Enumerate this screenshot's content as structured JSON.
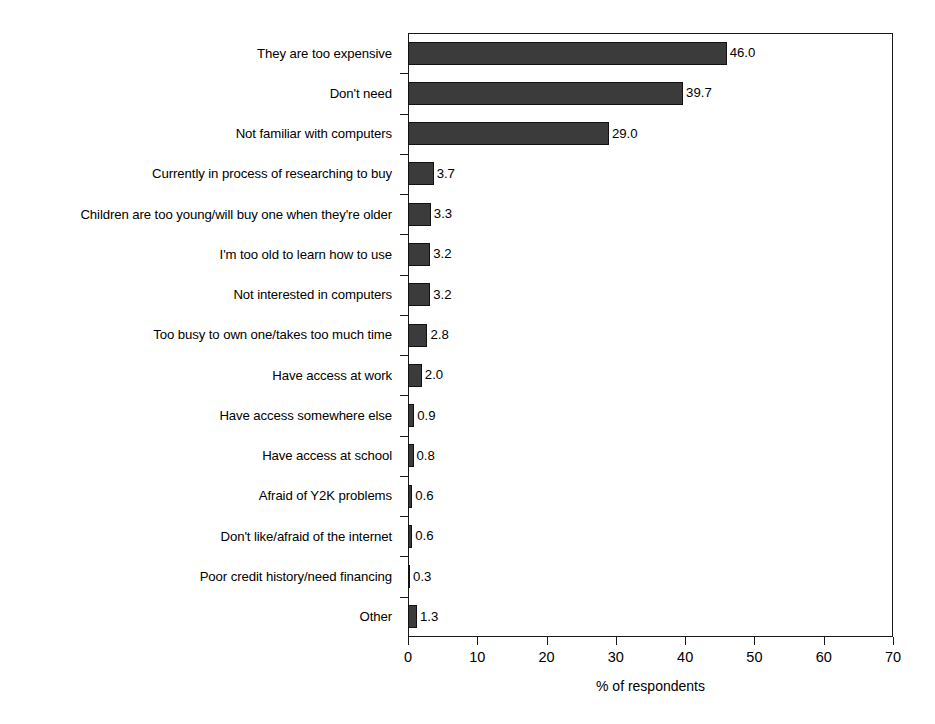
{
  "chart_data": {
    "type": "bar",
    "orientation": "horizontal",
    "title": "",
    "xlabel": "% of respondents",
    "ylabel": "",
    "xlim": [
      0,
      70
    ],
    "xticks": [
      0,
      10,
      20,
      30,
      40,
      50,
      60,
      70
    ],
    "grid": false,
    "legend": false,
    "bar_color": "#3b3b3b",
    "bar_edge_color": "#111111",
    "categories": [
      "They are too expensive",
      "Don't need",
      "Not familiar with computers",
      "Currently in process of researching to buy",
      "Children are too young/will buy one when they're older",
      "I'm too old to learn how to use",
      "Not interested in computers",
      "Too busy to own one/takes too much time",
      "Have access at work",
      "Have access somewhere else",
      "Have access at school",
      "Afraid of Y2K problems",
      "Don't like/afraid of the internet",
      "Poor credit history/need financing",
      "Other"
    ],
    "values": [
      46.0,
      39.7,
      29.0,
      3.7,
      3.3,
      3.2,
      3.2,
      2.8,
      2.0,
      0.9,
      0.8,
      0.6,
      0.6,
      0.3,
      1.3
    ],
    "value_labels": [
      "46.0",
      "39.7",
      "29.0",
      "3.7",
      "3.3",
      "3.2",
      "3.2",
      "2.8",
      "2.0",
      "0.9",
      "0.8",
      "0.6",
      "0.6",
      "0.3",
      "1.3"
    ],
    "xtick_labels": [
      "0",
      "10",
      "20",
      "30",
      "40",
      "50",
      "60",
      "70"
    ]
  }
}
